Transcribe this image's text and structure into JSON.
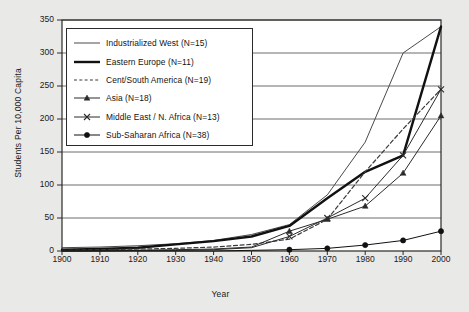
{
  "chart_data": {
    "type": "line",
    "title": "",
    "xlabel": "Year",
    "ylabel": "Students Per 10,000 Capita",
    "xlim": [
      1900,
      2000
    ],
    "ylim": [
      0,
      350
    ],
    "xticks": [
      1900,
      1910,
      1920,
      1930,
      1940,
      1950,
      1960,
      1970,
      1980,
      1990,
      2000
    ],
    "yticks": [
      0,
      50,
      100,
      150,
      200,
      250,
      300,
      350
    ],
    "grid": "horizontal",
    "legend_position": "upper-left-inside",
    "x": [
      1900,
      1910,
      1920,
      1930,
      1940,
      1950,
      1960,
      1970,
      1980,
      1990,
      2000
    ],
    "series": [
      {
        "name": "Industrialized West (N=15)",
        "label": "Industrialized West (N=15)",
        "style": "thin-solid",
        "marker": "none",
        "color": "#4a4a4a",
        "values": [
          5,
          6,
          8,
          11,
          16,
          25,
          40,
          85,
          165,
          300,
          340
        ]
      },
      {
        "name": "Eastern Europe (N=11)",
        "label": "Eastern Europe (N=11)",
        "style": "thick-solid",
        "marker": "none",
        "color": "#111111",
        "values": [
          2,
          3,
          5,
          10,
          15,
          22,
          38,
          80,
          120,
          145,
          340
        ]
      },
      {
        "name": "Cent/South America (N=19)",
        "label": "Cent/South America (N=19)",
        "style": "dashed",
        "marker": "none",
        "color": "#3a3a3a",
        "values": [
          1,
          2,
          3,
          4,
          6,
          10,
          18,
          48,
          120,
          185,
          245
        ]
      },
      {
        "name": "Asia (N=18)",
        "label": "Asia (N=18)",
        "style": "thin-solid",
        "marker": "triangle",
        "color": "#2b2b2b",
        "values": [
          0,
          1,
          1,
          2,
          3,
          6,
          30,
          48,
          68,
          118,
          205
        ]
      },
      {
        "name": "Middle East / N. Africa (N=13)",
        "label": "Middle East / N. Africa (N=13)",
        "style": "thin-solid",
        "marker": "x",
        "color": "#2b2b2b",
        "values": [
          0,
          0,
          1,
          1,
          2,
          5,
          22,
          50,
          80,
          145,
          245
        ]
      },
      {
        "name": "Sub-Saharan Africa (N=38)",
        "label": "Sub-Saharan Africa (N=38)",
        "style": "thin-solid",
        "marker": "dot",
        "color": "#111111",
        "values": [
          0,
          0,
          0,
          0,
          0,
          1,
          2,
          4,
          9,
          16,
          30
        ]
      }
    ]
  },
  "figure": {
    "background": "#e9e9e7",
    "plot_background": "#ffffff",
    "frame_color": "#2b2b2b",
    "gridline_color": "#6d6d6d"
  }
}
